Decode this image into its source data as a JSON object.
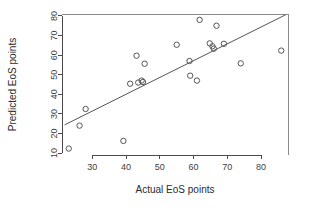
{
  "chart_data": {
    "type": "scatter",
    "title": "",
    "xlabel": "Actual EoS points",
    "ylabel": "Predicted EoS points",
    "xlim": [
      21,
      88
    ],
    "ylim": [
      9,
      81
    ],
    "xticks": [
      30,
      40,
      50,
      60,
      70,
      80
    ],
    "yticks": [
      10,
      20,
      30,
      40,
      50,
      60,
      70,
      80
    ],
    "xtick_labels": [
      "30",
      "40",
      "50",
      "60",
      "70",
      "80"
    ],
    "ytick_labels": [
      "10",
      "20",
      "30",
      "40",
      "50",
      "60",
      "70",
      "80"
    ],
    "grid": false,
    "legend": null,
    "point_marker": "open-circle",
    "point_color": "#555555",
    "line_color": "#555555",
    "points": [
      {
        "x": 23.0,
        "y": 12.3
      },
      {
        "x": 26.2,
        "y": 24.0
      },
      {
        "x": 28.0,
        "y": 32.5
      },
      {
        "x": 39.2,
        "y": 16.2
      },
      {
        "x": 41.2,
        "y": 45.4
      },
      {
        "x": 43.1,
        "y": 59.7
      },
      {
        "x": 43.6,
        "y": 46.0
      },
      {
        "x": 44.6,
        "y": 47.0
      },
      {
        "x": 45.0,
        "y": 46.3
      },
      {
        "x": 45.5,
        "y": 55.6
      },
      {
        "x": 55.0,
        "y": 65.3
      },
      {
        "x": 58.8,
        "y": 57.0
      },
      {
        "x": 59.0,
        "y": 49.5
      },
      {
        "x": 61.0,
        "y": 47.0
      },
      {
        "x": 61.8,
        "y": 78.0
      },
      {
        "x": 64.8,
        "y": 66.0
      },
      {
        "x": 65.6,
        "y": 64.5
      },
      {
        "x": 66.0,
        "y": 63.3
      },
      {
        "x": 66.8,
        "y": 75.0
      },
      {
        "x": 69.0,
        "y": 65.8
      },
      {
        "x": 74.0,
        "y": 55.8
      },
      {
        "x": 86.0,
        "y": 62.3
      }
    ],
    "fit_line": {
      "type": "line",
      "from": {
        "x": 21.8,
        "y": 24.4
      },
      "to": {
        "x": 87.3,
        "y": 80.6
      }
    }
  }
}
